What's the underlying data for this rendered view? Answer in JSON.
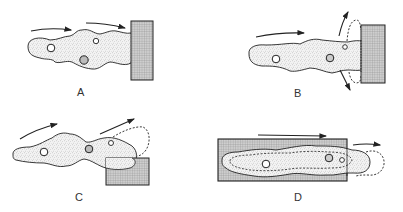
{
  "figure": {
    "colors": {
      "ink": "#222222",
      "cell_fill": "#f1f1f1",
      "stipple": "#777777",
      "block_fill": "#c8c8c8",
      "block_hatch": "#8a8a8a",
      "background": "#ffffff"
    },
    "panels": [
      {
        "id": "A",
        "label": "A",
        "content": "cell moving right; leading edge contacts and flattens against block"
      },
      {
        "id": "B",
        "label": "B",
        "content": "leading edge against block; dashed outlines show lamellae spreading up and down along block face with diverging arrows"
      },
      {
        "id": "C",
        "label": "C",
        "content": "cell climbing over corner of block; dashed outline curling over top"
      },
      {
        "id": "D",
        "label": "D",
        "content": "elongated cell lying on top of large block; dashed inner outline; leading end extends beyond block edge with dashed bulge; arrows pointing right"
      }
    ]
  }
}
